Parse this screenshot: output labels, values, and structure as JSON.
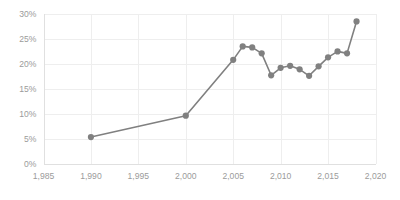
{
  "chart_data": {
    "type": "line",
    "title": "",
    "subtitle": "",
    "xlabel": "",
    "ylabel": "",
    "xlim": [
      1985,
      2020
    ],
    "ylim": [
      0,
      0.3
    ],
    "grid": true,
    "legend": false,
    "legend_position": "none",
    "value_format": "percent",
    "series_color": "#808080",
    "grid_color": "#eeeeee",
    "axis_color": "#e0e0e0",
    "tick_label_color": "#9b9b9b",
    "x_tick_labels": [
      "1,985",
      "1,990",
      "1,995",
      "2,000",
      "2,005",
      "2,010",
      "2,015",
      "2,020"
    ],
    "x_tick_values": [
      1985,
      1990,
      1995,
      2000,
      2005,
      2010,
      2015,
      2020
    ],
    "y_tick_labels": [
      "0%",
      "5%",
      "10%",
      "15%",
      "20%",
      "25%",
      "30%"
    ],
    "y_tick_values": [
      0,
      0.05,
      0.1,
      0.15,
      0.2,
      0.25,
      0.3
    ],
    "series": [
      {
        "name": "series-1",
        "x": [
          1990,
          2000,
          2005,
          2006,
          2007,
          2008,
          2009,
          2010,
          2011,
          2012,
          2013,
          2014,
          2015,
          2016,
          2017,
          2018
        ],
        "values": [
          0.053,
          0.096,
          0.208,
          0.235,
          0.233,
          0.221,
          0.177,
          0.192,
          0.196,
          0.189,
          0.176,
          0.195,
          0.213,
          0.225,
          0.221,
          0.285
        ]
      }
    ]
  }
}
